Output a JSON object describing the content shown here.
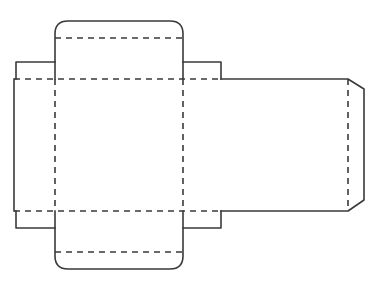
{
  "diagram": {
    "title": "Box net (dieline)",
    "type": "box-template",
    "line_color": "#3a3a3a",
    "background": "#ffffff",
    "legend": {
      "cut_line": "solid",
      "fold_line": "dashed"
    },
    "panels": [
      {
        "name": "top-tuck-flap",
        "shape": "rounded-top"
      },
      {
        "name": "top-panel"
      },
      {
        "name": "left-dust-flap-top"
      },
      {
        "name": "right-dust-flap-top"
      },
      {
        "name": "left-side-panel"
      },
      {
        "name": "front-panel"
      },
      {
        "name": "back-panel"
      },
      {
        "name": "glue-flap",
        "shape": "chamfered"
      },
      {
        "name": "left-dust-flap-bottom"
      },
      {
        "name": "right-dust-flap-bottom"
      },
      {
        "name": "bottom-panel"
      },
      {
        "name": "bottom-tuck-flap",
        "shape": "rounded-bottom"
      }
    ]
  }
}
